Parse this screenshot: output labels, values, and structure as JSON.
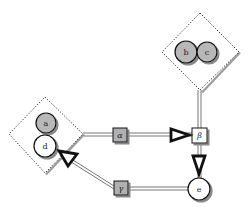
{
  "diagram": {
    "type": "network-diagram",
    "groups": [
      {
        "id": "group-bc",
        "nodes": [
          "b",
          "c"
        ],
        "shape": "dotted-diamond"
      },
      {
        "id": "group-ad",
        "nodes": [
          "a",
          "d"
        ],
        "shape": "dotted-diamond"
      }
    ],
    "nodes": {
      "a": {
        "label": "a",
        "shape": "circle",
        "fill": "#b8b8b8"
      },
      "b": {
        "label": "b",
        "shape": "circle",
        "fill": "#b8b8b8"
      },
      "c": {
        "label": "c",
        "shape": "circle",
        "fill": "#b8b8b8"
      },
      "d": {
        "label": "d",
        "shape": "circle",
        "fill": "#ffffff"
      },
      "e": {
        "label": "e",
        "shape": "circle",
        "fill": "#ffffff"
      },
      "alpha": {
        "label": "α",
        "shape": "square",
        "fill": "#b0b0b0"
      },
      "beta": {
        "label": "β",
        "shape": "square",
        "fill": "#ffffff"
      },
      "gamma": {
        "label": "γ",
        "shape": "square",
        "fill": "#b0b0b0"
      }
    },
    "edges": [
      {
        "from": "group-ad",
        "to": "alpha",
        "style": "double-line"
      },
      {
        "from": "alpha",
        "to": "beta",
        "style": "double-line",
        "arrow": "open-triangle"
      },
      {
        "from": "group-bc",
        "to": "beta",
        "style": "double-line"
      },
      {
        "from": "beta",
        "to": "e",
        "style": "double-line",
        "arrow": "open-triangle"
      },
      {
        "from": "e",
        "to": "gamma",
        "style": "double-line"
      },
      {
        "from": "gamma",
        "to": "group-ad",
        "style": "double-line",
        "arrow": "open-triangle"
      }
    ],
    "colors": {
      "stroke": "#111111",
      "gray_fill": "#b8b8b8",
      "shadow": "#9a9a9a",
      "background": "#ffffff"
    }
  }
}
